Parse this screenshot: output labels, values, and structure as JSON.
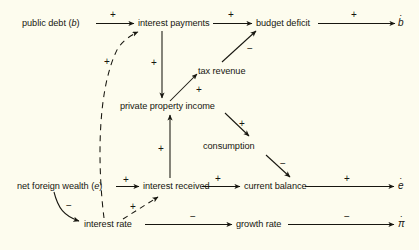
{
  "diagram": {
    "background_color": "#fdfcee",
    "ink_color": "#17160f",
    "nodes": [
      {
        "id": "public_debt",
        "label": "public debt (",
        "label_italic": "b",
        "label_tail": ")"
      },
      {
        "id": "interest_payments",
        "label": "interest payments"
      },
      {
        "id": "budget_deficit",
        "label": "budget deficit"
      },
      {
        "id": "tax_revenue",
        "label": "tax revenue"
      },
      {
        "id": "private_property_income",
        "label": "private property income"
      },
      {
        "id": "consumption",
        "label": "consumption"
      },
      {
        "id": "net_foreign_wealth",
        "label": "net foreign wealth (",
        "label_italic": "e",
        "label_tail": ")"
      },
      {
        "id": "interest_received",
        "label": "interest received"
      },
      {
        "id": "current_balance",
        "label": "current balance"
      },
      {
        "id": "interest_rate",
        "label": "interest rate"
      },
      {
        "id": "growth_rate",
        "label": "growth rate"
      }
    ],
    "outputs": [
      {
        "id": "b_dot",
        "glyph": "b",
        "dot": "·"
      },
      {
        "id": "e_dot",
        "glyph": "e",
        "dot": "·"
      },
      {
        "id": "pi_dot",
        "glyph": "π",
        "dot": "·"
      }
    ],
    "edges": [
      {
        "from": "public_debt",
        "to": "interest_payments",
        "sign": "+",
        "style": "solid"
      },
      {
        "from": "interest_payments",
        "to": "budget_deficit",
        "sign": "+",
        "style": "solid"
      },
      {
        "from": "budget_deficit",
        "to": "b_dot",
        "sign": "+",
        "style": "solid"
      },
      {
        "from": "interest_payments",
        "to": "private_property_income",
        "sign": "+",
        "style": "solid"
      },
      {
        "from": "private_property_income",
        "to": "tax_revenue",
        "sign": "+",
        "style": "solid"
      },
      {
        "from": "tax_revenue",
        "to": "budget_deficit",
        "sign": "−",
        "style": "solid"
      },
      {
        "from": "private_property_income",
        "to": "consumption",
        "sign": "+",
        "style": "solid"
      },
      {
        "from": "consumption",
        "to": "current_balance",
        "sign": "−",
        "style": "solid"
      },
      {
        "from": "net_foreign_wealth",
        "to": "interest_received",
        "sign": "+",
        "style": "solid"
      },
      {
        "from": "interest_received",
        "to": "current_balance",
        "sign": "+",
        "style": "solid"
      },
      {
        "from": "current_balance",
        "to": "e_dot",
        "sign": "+",
        "style": "solid"
      },
      {
        "from": "interest_received",
        "to": "private_property_income",
        "sign": "+",
        "style": "solid"
      },
      {
        "from": "net_foreign_wealth",
        "to": "interest_rate",
        "sign": "−",
        "style": "curved"
      },
      {
        "from": "interest_rate",
        "to": "growth_rate",
        "sign": "−",
        "style": "solid"
      },
      {
        "from": "growth_rate",
        "to": "pi_dot",
        "sign": "−",
        "style": "solid"
      },
      {
        "from": "interest_rate",
        "to": "interest_payments",
        "sign": "+",
        "style": "dashed-curved"
      },
      {
        "from": "interest_rate",
        "to": "interest_received",
        "sign": "+",
        "style": "dashed"
      }
    ],
    "signs": {
      "public_debt_to_interest_payments": "+",
      "interest_payments_to_budget_deficit": "+",
      "budget_deficit_to_bdot": "+",
      "interest_payments_to_ppi": "+",
      "ppi_to_tax_revenue": "+",
      "tax_revenue_to_budget_deficit": "−",
      "ppi_to_consumption": "+",
      "consumption_to_current_balance": "−",
      "nfw_to_interest_received": "+",
      "interest_received_to_current_balance": "+",
      "current_balance_to_edot": "+",
      "interest_received_to_ppi": "+",
      "nfw_to_interest_rate": "−",
      "interest_rate_to_growth_rate": "−",
      "growth_rate_to_pidot": "−",
      "interest_rate_to_interest_payments": "+",
      "interest_rate_to_interest_received": "+"
    }
  }
}
